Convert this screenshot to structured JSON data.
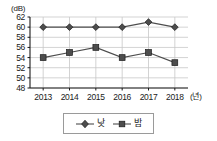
{
  "chart_data": {
    "type": "line",
    "title": "",
    "xlabel": "(년)",
    "ylabel": "(dB)",
    "categories": [
      "2013",
      "2014",
      "2015",
      "2016",
      "2017",
      "2018"
    ],
    "series": [
      {
        "name": "낮",
        "marker": "diamond",
        "color": "#4d4d4d",
        "values": [
          60,
          60,
          60,
          60,
          61,
          60
        ]
      },
      {
        "name": "밤",
        "marker": "square",
        "color": "#4d4d4d",
        "values": [
          54,
          55,
          56,
          54,
          55,
          53
        ]
      }
    ],
    "ylim": [
      48,
      62
    ],
    "yticks": [
      "48",
      "50",
      "52",
      "54",
      "56",
      "58",
      "60",
      "62"
    ],
    "grid": true,
    "grid_color": "#c8c8c8",
    "legend_position": "bottom"
  },
  "axis": {
    "y_unit": "(dB)",
    "x_unit": "(년)"
  },
  "legend": {
    "items": [
      {
        "label": "낮",
        "marker": "diamond-marker"
      },
      {
        "label": "밤",
        "marker": "square-marker"
      }
    ]
  }
}
